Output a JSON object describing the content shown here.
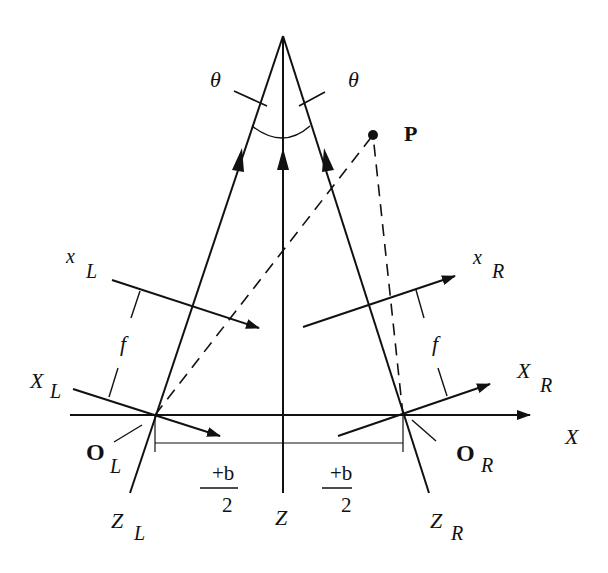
{
  "diagram": {
    "type": "stereo-camera-geometry",
    "colors": {
      "ink": "#111111",
      "background": "#ffffff"
    },
    "labels": {
      "theta_left": "θ",
      "theta_right": "θ",
      "point": "P",
      "x_left_main": "x",
      "x_left_sub": "L",
      "x_right_main": "x",
      "x_right_sub": "R",
      "f_left": "f",
      "f_right": "f",
      "X_left_main": "X",
      "X_left_sub": "L",
      "X_right_main": "X",
      "X_right_sub": "R",
      "O_left_main": "O",
      "O_left_sub": "L",
      "O_right_main": "O",
      "O_right_sub": "R",
      "X_axis": "X",
      "Z_axis": "Z",
      "Z_left_main": "Z",
      "Z_left_sub": "L",
      "Z_right_main": "Z",
      "Z_right_sub": "R",
      "half_baseline_left_num": "+b",
      "half_baseline_left_den": "2",
      "half_baseline_right_num": "+b",
      "half_baseline_right_den": "2"
    }
  }
}
